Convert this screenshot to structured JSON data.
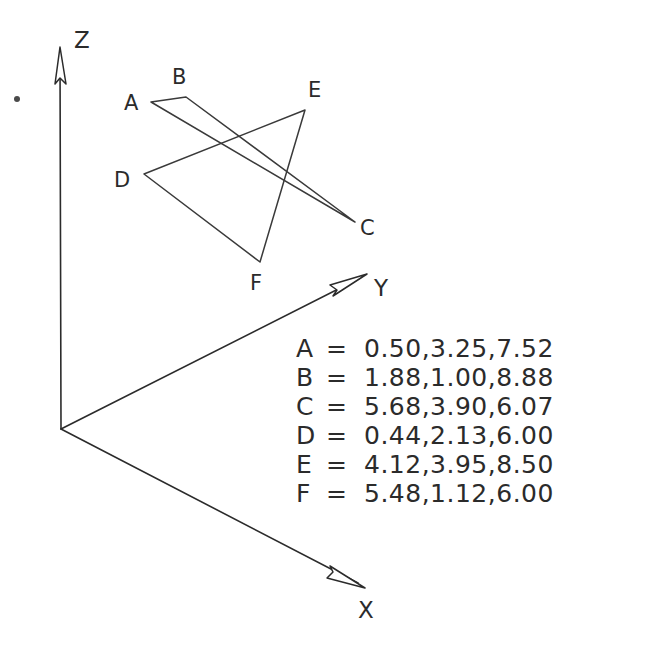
{
  "figure": {
    "background_color": "#ffffff",
    "line_color": "#3a3a3a",
    "axes": [
      {
        "name": "z-axis",
        "label": "Z",
        "origin": [
          61,
          429
        ],
        "tip": [
          60,
          47
        ],
        "label_pos": [
          74,
          48
        ]
      },
      {
        "name": "y-axis",
        "label": "Y",
        "origin": [
          61,
          429
        ],
        "tip": [
          367,
          274
        ],
        "label_pos": [
          374,
          296
        ]
      },
      {
        "name": "x-axis",
        "label": "X",
        "origin": [
          61,
          429
        ],
        "tip": [
          365,
          588
        ],
        "label_pos": [
          358,
          618
        ]
      }
    ],
    "triangles": [
      {
        "name": "triangle-abc",
        "vertices": [
          {
            "label": "A",
            "point": [
              151,
              102
            ],
            "label_pos": [
              124,
              110
            ]
          },
          {
            "label": "B",
            "point": [
              186,
              97
            ],
            "label_pos": [
              172,
              84
            ]
          },
          {
            "label": "C",
            "point": [
              355,
              222
            ],
            "label_pos": [
              360,
              235
            ]
          }
        ]
      },
      {
        "name": "triangle-def",
        "vertices": [
          {
            "label": "D",
            "point": [
              144,
              174
            ],
            "label_pos": [
              114,
              187
            ]
          },
          {
            "label": "E",
            "point": [
              305,
              110
            ],
            "label_pos": [
              308,
              97
            ]
          },
          {
            "label": "F",
            "point": [
              260,
              262
            ],
            "label_pos": [
              250,
              290
            ]
          }
        ]
      }
    ],
    "stray_dot": {
      "name": "stray-dot",
      "point": [
        17,
        99
      ],
      "radius": 3
    }
  },
  "coord_table": {
    "equals_sign": "=",
    "rows": [
      {
        "name": "A",
        "values": "0.50,3.25,7.52"
      },
      {
        "name": "B",
        "values": "1.88,1.00,8.88"
      },
      {
        "name": "C",
        "values": "5.68,3.90,6.07"
      },
      {
        "name": "D",
        "values": "0.44,2.13,6.00"
      },
      {
        "name": "E",
        "values": "4.12,3.95,8.50"
      },
      {
        "name": "F",
        "values": "5.48,1.12,6.00"
      }
    ]
  }
}
